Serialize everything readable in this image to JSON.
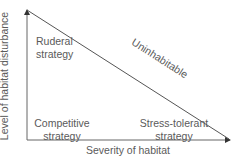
{
  "diagram": {
    "type": "triangle-strategy-diagram",
    "axes": {
      "y_label": "Level of habitat disturbance",
      "x_label": "Severity of habitat"
    },
    "diagonal_label": "Uninhabitable",
    "regions": [
      {
        "id": "ruderal",
        "line1": "Ruderal",
        "line2": "strategy"
      },
      {
        "id": "competitive",
        "line1": "Competitive",
        "line2": "strategy"
      },
      {
        "id": "stress-tolerant",
        "line1": "Stress-tolerant",
        "line2": "strategy"
      }
    ],
    "colors": {
      "line": "#555555",
      "text": "#5a5a5a",
      "background": "#ffffff"
    }
  }
}
